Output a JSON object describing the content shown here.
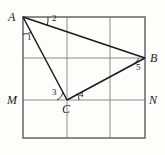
{
  "figure": {
    "background_color": "#fdfdfc",
    "grid_color": "#8b8b8b",
    "border_color": "#6e6e6e",
    "segment_color": "#1b1b1b",
    "rect": {
      "left": 23,
      "top": 17,
      "right": 145,
      "bottom": 138
    },
    "grid": {
      "vertical_x": [
        67,
        110
      ],
      "horizontal_y": [
        58,
        100
      ]
    },
    "points": {
      "A": {
        "x": 23,
        "y": 17,
        "label": "A",
        "label_x": 8,
        "label_y": 11
      },
      "B": {
        "x": 145,
        "y": 58,
        "label": "B",
        "label_x": 150,
        "label_y": 52
      },
      "C": {
        "x": 67,
        "y": 100,
        "label": "C",
        "label_x": 62,
        "label_y": 104
      },
      "M": {
        "x": 23,
        "y": 100,
        "label": "M",
        "label_x": 7,
        "label_y": 94
      },
      "N": {
        "x": 145,
        "y": 100,
        "label": "N",
        "label_x": 149,
        "label_y": 94
      }
    },
    "segments": [
      {
        "name": "AB",
        "from": "A",
        "to": "B"
      },
      {
        "name": "AC",
        "from": "A",
        "to": "C"
      },
      {
        "name": "CB",
        "from": "C",
        "to": "B"
      }
    ],
    "angles": [
      {
        "id": "1",
        "label": "1",
        "vertex": "A",
        "label_x": 27,
        "label_y": 35,
        "arc": "between AM and AC"
      },
      {
        "id": "2",
        "label": "2",
        "vertex": "A",
        "label_x": 52,
        "label_y": 17,
        "arc": "between AB and top edge"
      },
      {
        "id": "3",
        "label": "3",
        "vertex": "C",
        "label_x": 53,
        "label_y": 89,
        "arc": "between CA and CM"
      },
      {
        "id": "4",
        "label": "4",
        "vertex": "C",
        "label_x": 77,
        "label_y": 90,
        "arc": "between CB and CN"
      },
      {
        "id": "5",
        "label": "5",
        "vertex": "B",
        "label_x": 136,
        "label_y": 63,
        "arc": "between BC and BN"
      }
    ]
  }
}
